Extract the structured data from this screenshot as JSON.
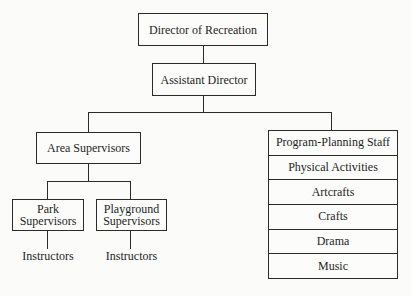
{
  "chart": {
    "nodes": {
      "director": {
        "label": "Director of Recreation"
      },
      "assistant": {
        "label": "Assistant Director"
      },
      "area_supervisors": {
        "label": "Area Supervisors"
      },
      "park_supervisors": {
        "line1": "Park",
        "line2": "Supervisors"
      },
      "playground_supervisors": {
        "line1": "Playground",
        "line2": "Supervisors"
      },
      "park_instructors": {
        "label": "Instructors"
      },
      "playground_instructors": {
        "label": "Instructors"
      }
    },
    "program_planning": {
      "rows": [
        {
          "label": "Program-Planning Staff"
        },
        {
          "label": "Physical Activities"
        },
        {
          "label": "Artcrafts"
        },
        {
          "label": "Crafts"
        },
        {
          "label": "Drama"
        },
        {
          "label": "Music"
        }
      ]
    },
    "hierarchy": [
      {
        "parent": "Director of Recreation",
        "children": [
          "Assistant Director"
        ]
      },
      {
        "parent": "Assistant Director",
        "children": [
          "Area Supervisors",
          "Program-Planning Staff"
        ]
      },
      {
        "parent": "Area Supervisors",
        "children": [
          "Park Supervisors",
          "Playground Supervisors"
        ]
      },
      {
        "parent": "Park Supervisors",
        "children": [
          "Instructors"
        ]
      },
      {
        "parent": "Playground Supervisors",
        "children": [
          "Instructors"
        ]
      },
      {
        "parent": "Program-Planning Staff",
        "children": [
          "Physical Activities",
          "Artcrafts",
          "Crafts",
          "Drama",
          "Music"
        ]
      }
    ]
  }
}
